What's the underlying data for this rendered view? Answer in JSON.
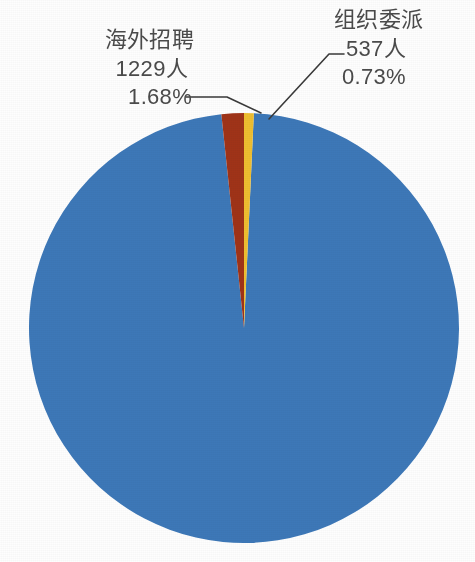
{
  "chart_data": {
    "type": "pie",
    "title": "",
    "subtitle": "",
    "xlabel": "",
    "ylabel": "",
    "legend_position": "none",
    "grid": false,
    "total_people": 73182,
    "units": "人",
    "slices": [
      {
        "name": "",
        "label_visible": false,
        "count": null,
        "count_text": "",
        "percent": 97.59,
        "percent_text": "",
        "color": "#3d78b8",
        "start_angle_deg": 5.4,
        "sweep_deg": 351.3
      },
      {
        "name": "海外招聘",
        "label_visible": true,
        "count": 1229,
        "count_text": "1229人",
        "percent": 1.68,
        "percent_text": "1.68%",
        "color": "#a03318",
        "start_angle_deg": 354.0,
        "sweep_deg": 6.05
      },
      {
        "name": "组织委派",
        "label_visible": true,
        "count": 537,
        "count_text": "537人",
        "percent": 0.73,
        "percent_text": "0.73%",
        "color": "#efbe30",
        "start_angle_deg": 0.05,
        "sweep_deg": 2.63
      }
    ]
  },
  "callouts": {
    "left": {
      "name": "海外招聘",
      "count": "1229人",
      "percent": "1.68%"
    },
    "right": {
      "name": "组织委派",
      "count": "537人",
      "percent": "0.73%"
    }
  },
  "colors": {
    "slice_primary": "#3d78b8",
    "slice_red": "#a03318",
    "slice_yellow": "#efbe30",
    "label_text": "#4a4a4a",
    "leader_line": "#3a3a3a",
    "background": "#fefefe"
  }
}
